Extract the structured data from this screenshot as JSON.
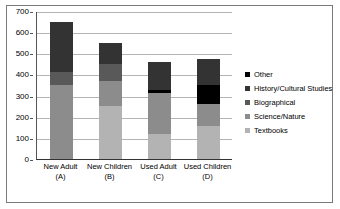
{
  "chart_data": {
    "type": "bar",
    "stacked": true,
    "title": "",
    "subtitle": "",
    "xlabel": "",
    "ylabel": "",
    "ylim": [
      0,
      700
    ],
    "ytick_step": 100,
    "yticks": [
      0,
      100,
      200,
      300,
      400,
      500,
      600,
      700
    ],
    "grid": true,
    "legend_position": "right",
    "categories": [
      "New Adult\n(A)",
      "New Children\n(B)",
      "Used Adult\n(C)",
      "Used Children\n(D)"
    ],
    "category_labels": [
      {
        "line1": "New Adult",
        "line2": "(A)"
      },
      {
        "line1": "New Children",
        "line2": "(B)"
      },
      {
        "line1": "Used Adult",
        "line2": "(C)"
      },
      {
        "line1": "Used Children",
        "line2": "(D)"
      }
    ],
    "series": [
      {
        "name": "Textbooks",
        "color": "#b3b3b3",
        "values": [
          0,
          250,
          120,
          155
        ]
      },
      {
        "name": "Science/Nature",
        "color": "#8c8c8c",
        "values": [
          350,
          120,
          190,
          105
        ]
      },
      {
        "name": "Biographical",
        "color": "#595959",
        "values": [
          60,
          80,
          0,
          0
        ]
      },
      {
        "name": "History/Cultural Studies",
        "color": "#333333",
        "values": [
          238,
          98,
          133,
          122
        ]
      },
      {
        "name": "Other",
        "color": "#000000",
        "values": [
          0,
          0,
          15,
          90
        ]
      }
    ],
    "stack_order_bottom_to_top": [
      "Textbooks",
      "Science/Nature",
      "Biographical",
      "Other",
      "History/Cultural Studies"
    ],
    "totals": [
      648,
      548,
      458,
      472
    ]
  },
  "legend": {
    "entries": [
      {
        "label": "Other",
        "color": "#000000"
      },
      {
        "label": "History/Cultural Studies",
        "color": "#333333"
      },
      {
        "label": "Biographical",
        "color": "#595959"
      },
      {
        "label": "Science/Nature",
        "color": "#8c8c8c"
      },
      {
        "label": "Textbooks",
        "color": "#b3b3b3"
      }
    ]
  },
  "colors": {
    "frame": "#7a7a7a",
    "grid": "#b4b4b4",
    "axis": "#333333",
    "background": "#ffffff"
  }
}
